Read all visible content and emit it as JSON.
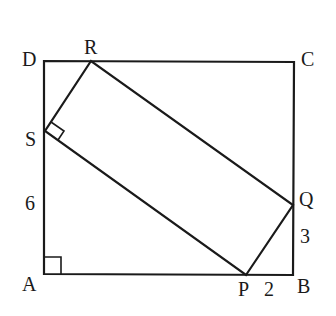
{
  "figure": {
    "type": "geometry",
    "colors": {
      "stroke": "#1a1a1a",
      "background": "#ffffff"
    }
  },
  "points": {
    "A": {
      "label": "A",
      "x": 44,
      "y": 274
    },
    "B": {
      "label": "B",
      "x": 293,
      "y": 275
    },
    "C": {
      "label": "C",
      "x": 294,
      "y": 62
    },
    "D": {
      "label": "D",
      "x": 44,
      "y": 61
    },
    "P": {
      "label": "P",
      "x": 246,
      "y": 275
    },
    "Q": {
      "label": "Q",
      "x": 293,
      "y": 205
    },
    "R": {
      "label": "R",
      "x": 91,
      "y": 61
    },
    "S": {
      "label": "S",
      "x": 45,
      "y": 131
    }
  },
  "measurements": {
    "AS": "6",
    "BQ": "3",
    "PB": "2"
  },
  "right_angles": [
    "A",
    "S"
  ]
}
